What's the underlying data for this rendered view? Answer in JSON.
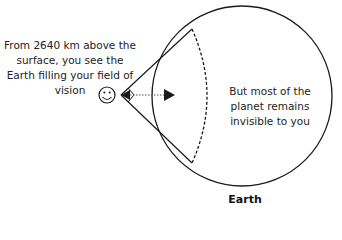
{
  "diagram": {
    "observer_caption": "From 2640 km above the surface, you see the Earth filling your field of vision",
    "hidden_caption": "But most of the planet remains invisible to you",
    "earth_label": "Earth",
    "observer_icon": "smiley-face-icon",
    "distance_km": 2640,
    "colors": {
      "stroke": "#1a1a1a",
      "background": "#ffffff"
    }
  }
}
